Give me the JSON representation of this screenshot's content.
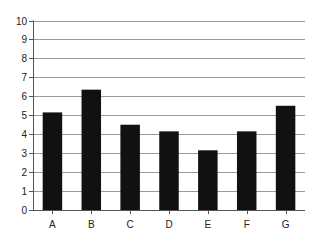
{
  "chart_data": {
    "type": "bar",
    "title": "",
    "xlabel": "",
    "ylabel": "",
    "categories": [
      "A",
      "B",
      "C",
      "D",
      "E",
      "F",
      "G"
    ],
    "values": [
      5.15,
      6.35,
      4.5,
      4.15,
      3.15,
      4.15,
      5.5
    ],
    "ylim": [
      0,
      10
    ],
    "yticks": [
      "0",
      "1",
      "2",
      "3",
      "4",
      "5",
      "6",
      "7",
      "8",
      "9",
      "10"
    ],
    "grid": true,
    "legend": null
  },
  "colors": {
    "bar": "#111111",
    "grid": "#9a9a9a",
    "axis": "#555555",
    "text": "#222222"
  }
}
